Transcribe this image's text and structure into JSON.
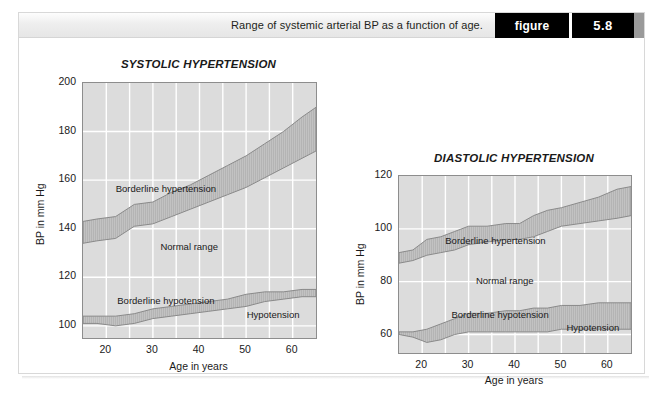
{
  "caption": {
    "text": "Range of systemic arterial BP as a function of age.",
    "figure_word": "figure",
    "figure_number": "5.8"
  },
  "colors": {
    "plot_background": "#dcdcdc",
    "gridline": "#ffffff",
    "band_fill": "#c2c2c2",
    "band_stroke": "#8a8a8a",
    "axis": "#8d8d8d",
    "text": "#1a1a1a",
    "caption_bar_bg": "#eeeeee",
    "figure_tag_bg": "#000000",
    "figure_tag_text": "#ffffff"
  },
  "charts": [
    {
      "id": "systolic",
      "title": "SYSTOLIC HYPERTENSION",
      "xlabel": "Age in years",
      "ylabel": "BP in mm Hg",
      "xticks": [
        20,
        30,
        40,
        50,
        60
      ],
      "yticks": [
        100,
        120,
        140,
        160,
        180,
        200
      ],
      "xlim": [
        15,
        65
      ],
      "ylim": [
        95,
        200
      ],
      "band_labels": {
        "hypertension": "Borderline hypertension",
        "normal": "Normal range",
        "hypotension": "Borderline hypotension",
        "low": "Hypotension"
      }
    },
    {
      "id": "diastolic",
      "title": "DIASTOLIC HYPERTENSION",
      "xlabel": "Age in years",
      "ylabel": "BP in mm Hg",
      "xticks": [
        20,
        30,
        40,
        50,
        60
      ],
      "yticks": [
        60,
        80,
        100,
        120
      ],
      "xlim": [
        15,
        65
      ],
      "ylim": [
        53,
        120
      ],
      "band_labels": {
        "hypertension": "Borderline hypertension",
        "normal": "Normal range",
        "hypotension": "Borderline hypotension",
        "low": "Hypotension"
      }
    }
  ],
  "chart_data": [
    {
      "type": "area",
      "id": "systolic",
      "title": "SYSTOLIC HYPERTENSION",
      "xlabel": "Age in years",
      "ylabel": "BP in mm Hg",
      "xlim": [
        15,
        65
      ],
      "ylim": [
        95,
        200
      ],
      "xticks": [
        20,
        30,
        40,
        50,
        60
      ],
      "yticks": [
        100,
        120,
        140,
        160,
        180,
        200
      ],
      "grid": true,
      "legend": "none",
      "x": [
        15,
        18,
        22,
        26,
        30,
        34,
        38,
        42,
        46,
        50,
        54,
        58,
        62,
        65
      ],
      "series": [
        {
          "name": "Borderline hypertension upper",
          "values": [
            143,
            144,
            145,
            150,
            151,
            155,
            158,
            162,
            166,
            170,
            175,
            180,
            186,
            190
          ]
        },
        {
          "name": "Borderline hypertension lower",
          "values": [
            134,
            135,
            136,
            141,
            142,
            145,
            148,
            151,
            154,
            157,
            161,
            165,
            169,
            172
          ]
        },
        {
          "name": "Borderline hypotension upper",
          "values": [
            104,
            104,
            104,
            105,
            107,
            108,
            109,
            110,
            111,
            113,
            114,
            114,
            115,
            115
          ]
        },
        {
          "name": "Borderline hypotension lower",
          "values": [
            101,
            101,
            100,
            101,
            103,
            104,
            105,
            106,
            107,
            108,
            110,
            111,
            112,
            112
          ]
        }
      ],
      "annotations": [
        {
          "text": "Borderline hypertension",
          "x": 33,
          "y": 156
        },
        {
          "text": "Normal range",
          "x": 38,
          "y": 132
        },
        {
          "text": "Borderline hypotension",
          "x": 33,
          "y": 110
        },
        {
          "text": "Hypotension",
          "x": 56,
          "y": 104
        }
      ]
    },
    {
      "type": "area",
      "id": "diastolic",
      "title": "DIASTOLIC HYPERTENSION",
      "xlabel": "Age in years",
      "ylabel": "BP in mm Hg",
      "xlim": [
        15,
        65
      ],
      "ylim": [
        53,
        120
      ],
      "xticks": [
        20,
        30,
        40,
        50,
        60
      ],
      "yticks": [
        60,
        80,
        100,
        120
      ],
      "grid": true,
      "legend": "none",
      "x": [
        15,
        18,
        21,
        24,
        27,
        30,
        34,
        38,
        41,
        44,
        47,
        50,
        54,
        58,
        62,
        65
      ],
      "series": [
        {
          "name": "Borderline hypertension upper",
          "values": [
            91,
            92,
            96,
            97,
            99,
            101,
            101,
            102,
            102,
            105,
            107,
            108,
            110,
            112,
            115,
            116
          ]
        },
        {
          "name": "Borderline hypertension lower",
          "values": [
            87,
            88,
            90,
            91,
            92,
            94,
            95,
            96,
            96,
            97,
            99,
            101,
            102,
            103,
            104,
            105
          ]
        },
        {
          "name": "Borderline hypotension upper",
          "values": [
            61,
            61,
            62,
            64,
            66,
            68,
            68,
            69,
            69,
            70,
            70,
            71,
            71,
            72,
            72,
            72
          ]
        },
        {
          "name": "Borderline hypotension lower",
          "values": [
            60,
            59,
            57,
            58,
            60,
            61,
            61,
            61,
            61,
            61,
            61,
            62,
            62,
            62,
            62,
            62
          ]
        }
      ],
      "annotations": [
        {
          "text": "Borderline hypertension",
          "x": 36,
          "y": 95
        },
        {
          "text": "Normal range",
          "x": 38,
          "y": 80
        },
        {
          "text": "Borderline hypotension",
          "x": 37,
          "y": 67
        },
        {
          "text": "Hypotension",
          "x": 57,
          "y": 62
        }
      ]
    }
  ]
}
